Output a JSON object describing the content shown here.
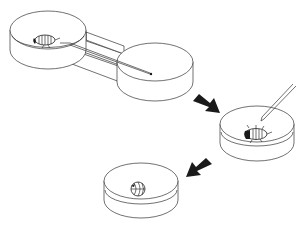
{
  "figure": {
    "description": "Three-step procedure: an isopod in a two-chamber connected dish apparatus with a probe, then the isopod is touched with a pipette/probe in a single dish, then it rolls into a ball (conglobation) in a dish.",
    "colors": {
      "line": "#333333",
      "arrow": "#1a1a1a",
      "background": "#ffffff"
    },
    "steps": [
      {
        "id": "step-1",
        "label": "two-chamber dish with isopod and probe"
      },
      {
        "id": "step-2",
        "label": "isopod stimulated with pipette in dish"
      },
      {
        "id": "step-3",
        "label": "isopod rolled into ball in dish"
      }
    ],
    "arrows": [
      {
        "from": "step-1",
        "to": "step-2",
        "direction": "down-right"
      },
      {
        "from": "step-2",
        "to": "step-3",
        "direction": "down-left"
      }
    ]
  }
}
